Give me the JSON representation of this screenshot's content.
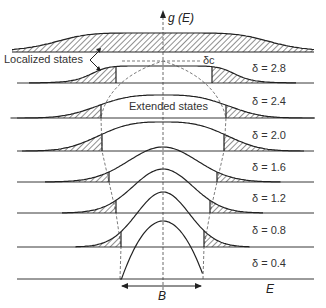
{
  "diagram": {
    "axis_label": "g (E)",
    "x_axis_label": "E",
    "bandwidth_label": "B",
    "localized_label": "Localized states",
    "extended_label": "Extended states",
    "critical_label": "δc",
    "curves": [
      {
        "label": "δ = 2.8",
        "baseline": 83,
        "top": 66,
        "edgeL": 116,
        "edgeR": 212,
        "spread": 86
      },
      {
        "label": "δ = 2.4",
        "baseline": 118,
        "top": 95,
        "edgeL": 101,
        "edgeR": 226,
        "spread": 90
      },
      {
        "label": "δ = 2.0",
        "baseline": 151,
        "top": 122,
        "edgeL": 102,
        "edgeR": 224,
        "spread": 80
      },
      {
        "label": "δ = 1.6",
        "baseline": 182,
        "top": 147,
        "edgeL": 109,
        "edgeR": 217,
        "spread": 64
      },
      {
        "label": "δ = 1.2",
        "baseline": 213,
        "top": 169,
        "edgeL": 116,
        "edgeR": 210,
        "spread": 54
      },
      {
        "label": "δ = 0.8",
        "baseline": 247,
        "top": 192,
        "edgeL": 121,
        "edgeR": 204,
        "spread": 46
      },
      {
        "label": "δ = 0.4",
        "baseline": 279,
        "top": 221,
        "edgeL": 120,
        "edgeR": 203,
        "spread": 0
      }
    ],
    "top_curve": {
      "baseline": 52,
      "top": 33
    }
  }
}
